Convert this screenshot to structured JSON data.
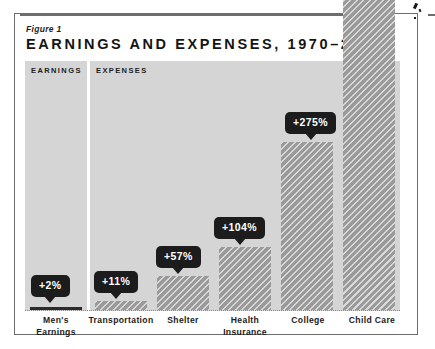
{
  "figure": {
    "label": "Figure 1",
    "title": "EARNINGS AND EXPENSES, 1970–2015"
  },
  "sections": {
    "earnings_label": "EARNINGS",
    "expenses_label": "EXPENSES"
  },
  "colors": {
    "panel_background": "#d5d5d5",
    "bar_fill": "#9a9a9a",
    "callout_background": "#1c1c1c",
    "callout_text": "#ffffff",
    "frame_border": "#6d6d6d",
    "text": "#1b1b1b",
    "page_background": "#ffffff"
  },
  "chart_data": {
    "type": "bar",
    "title": "EARNINGS AND EXPENSES, 1970–2015",
    "subtitle": "Figure 1",
    "xlabel": "",
    "ylabel": "",
    "grid": false,
    "legend": "none",
    "units": "percent change",
    "ylim": [
      0,
      300
    ],
    "categories": [
      "Men's Earnings",
      "Transportation",
      "Shelter",
      "Health Insurance",
      "College",
      "Child Care"
    ],
    "values": [
      2,
      11,
      57,
      104,
      275,
      500
    ],
    "data_labels": [
      "+2%",
      "+11%",
      "+57%",
      "+104%",
      "+275%",
      ""
    ],
    "groups": [
      {
        "name": "EARNINGS",
        "categories": [
          "Men's Earnings"
        ]
      },
      {
        "name": "EXPENSES",
        "categories": [
          "Transportation",
          "Shelter",
          "Health Insurance",
          "College",
          "Child Care"
        ]
      }
    ]
  },
  "bars": [
    {
      "name": "mens-earnings",
      "label_line1": "Men's",
      "label_line2": "Earnings",
      "callout": "+2%",
      "x": 30,
      "width": 52,
      "height": 3,
      "callout_left": 31,
      "callout_top": 275,
      "label_left": 24,
      "label_width": 64,
      "tiny": true
    },
    {
      "name": "transportation",
      "label_line1": "Transportation",
      "label_line2": "",
      "callout": "+11%",
      "x": 95,
      "width": 52,
      "height": 9,
      "callout_left": 94,
      "callout_top": 271,
      "label_left": 82,
      "label_width": 78,
      "tiny": false
    },
    {
      "name": "shelter",
      "label_line1": "Shelter",
      "label_line2": "",
      "callout": "+57%",
      "x": 157,
      "width": 52,
      "height": 34,
      "callout_left": 156,
      "callout_top": 246,
      "label_left": 151,
      "label_width": 64,
      "tiny": false
    },
    {
      "name": "health-insurance",
      "label_line1": "Health",
      "label_line2": "Insurance",
      "callout": "+104%",
      "x": 219,
      "width": 52,
      "height": 63,
      "callout_left": 214,
      "callout_top": 217,
      "label_left": 212,
      "label_width": 66,
      "tiny": false
    },
    {
      "name": "college",
      "label_left": 276,
      "label_line1": "College",
      "label_line2": "",
      "callout": "+275%",
      "x": 281,
      "width": 52,
      "height": 168,
      "callout_left": 285,
      "callout_top": 112,
      "label_width": 64,
      "tiny": false
    },
    {
      "name": "child-care",
      "label_line1": "Child Care",
      "label_line2": "",
      "callout": "",
      "x": 343,
      "width": 52,
      "height": 310,
      "callout_left": 0,
      "callout_top": 0,
      "label_left": 337,
      "label_width": 70,
      "tiny": false
    }
  ]
}
